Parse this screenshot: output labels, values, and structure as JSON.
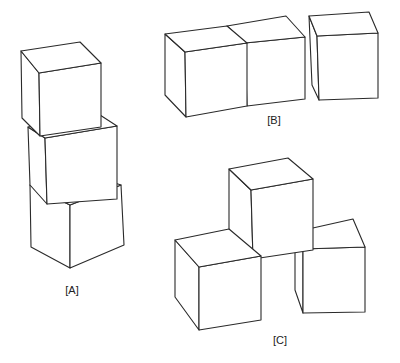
{
  "figure": {
    "stacks": [
      {
        "id": "A",
        "label": "[A]",
        "description": "Three cubes stacked vertically, each rotated slightly"
      },
      {
        "id": "B",
        "label": "[B]",
        "description": "Three cubes placed side by side in a row"
      },
      {
        "id": "C",
        "label": "[C]",
        "description": "Two cubes on the bottom with one cube resting on top between them"
      }
    ],
    "colors": {
      "line": "#2a2a2a",
      "fill": "#ffffff",
      "background": "#ffffff"
    }
  }
}
